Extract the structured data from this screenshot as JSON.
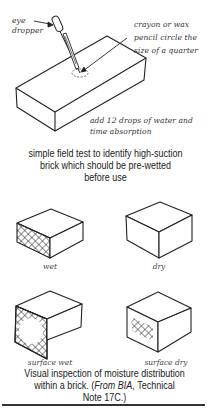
{
  "figure_top": {
    "annotations": {
      "eye_dropper": [
        "eye",
        "dropper"
      ],
      "crayon": [
        "crayon or wax",
        "pencil circle the",
        "size of a quarter"
      ],
      "drops": [
        "add 12 drops of water and",
        "time absorption"
      ]
    },
    "caption": [
      "simple field test to identify high-suction",
      "brick which should be pre-wetted",
      "before use"
    ]
  },
  "figure_bottom": {
    "bricks": [
      {
        "label": "wet",
        "pattern": "full-crosshatch"
      },
      {
        "label": "dry",
        "pattern": "none"
      },
      {
        "label": "surface wet",
        "pattern": "border-crosshatch"
      },
      {
        "label": "surface dry",
        "pattern": "center-crosshatch"
      }
    ],
    "caption": {
      "line1": "Visual inspection of moisture distribution",
      "line2_pre": "within a brick. (",
      "line2_italic": "From BIA",
      "line2_post": ", Technical",
      "line3": "Note 17C.)"
    }
  }
}
